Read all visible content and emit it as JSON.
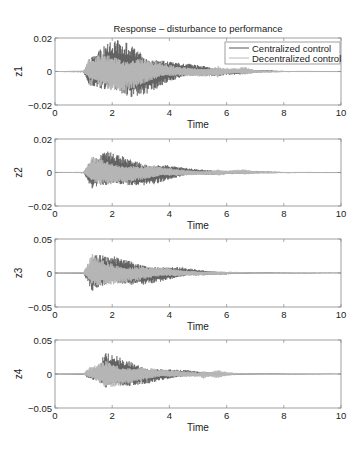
{
  "chart_data": [
    {
      "type": "line",
      "title": "Response – disturbance to performance",
      "xlabel": "Time",
      "ylabel": "z1",
      "xlim": [
        0,
        10
      ],
      "ylim": [
        -0.02,
        0.02
      ],
      "xticks": [
        "0",
        "2",
        "4",
        "6",
        "8",
        "10"
      ],
      "yticks": [
        "-0.02",
        "0",
        "0.02"
      ],
      "grid": false,
      "legend": {
        "position": "upper right",
        "entries": [
          "Centralized control",
          "Decentralized control"
        ]
      },
      "series": [
        {
          "name": "Centralized control",
          "color": "#555555",
          "envelope": {
            "t": [
              0,
              1.0,
              1.2,
              1.5,
              1.8,
              2.2,
              2.5,
              2.8,
              3.2,
              3.6,
              4.0,
              4.5,
              5.0,
              5.5,
              5.7,
              6.0,
              6.4,
              6.6,
              7.0,
              7.5,
              8.0,
              10
            ],
            "amp": [
              0.0003,
              0.0005,
              0.009,
              0.013,
              0.017,
              0.019,
              0.019,
              0.017,
              0.014,
              0.01,
              0.007,
              0.005,
              0.004,
              0.003,
              0.003,
              0.002,
              0.002,
              0.002,
              0.001,
              0.0007,
              0.0004,
              0.0002
            ]
          }
        },
        {
          "name": "Decentralized control",
          "color": "#b8b8b8",
          "envelope": {
            "t": [
              0,
              1.0,
              1.2,
              1.5,
              1.8,
              2.2,
              2.5,
              2.8,
              3.2,
              3.6,
              4.0,
              4.5,
              5.0,
              5.5,
              5.7,
              6.0,
              6.4,
              6.6,
              7.0,
              7.5,
              8.0,
              10
            ],
            "amp": [
              0.0003,
              0.0005,
              0.008,
              0.011,
              0.012,
              0.012,
              0.011,
              0.01,
              0.008,
              0.006,
              0.004,
              0.003,
              0.003,
              0.003,
              0.004,
              0.002,
              0.002,
              0.003,
              0.001,
              0.0006,
              0.0004,
              0.0002
            ]
          }
        }
      ]
    },
    {
      "type": "line",
      "xlabel": "Time",
      "ylabel": "z2",
      "xlim": [
        0,
        10
      ],
      "ylim": [
        -0.02,
        0.02
      ],
      "xticks": [
        "0",
        "2",
        "4",
        "6",
        "8",
        "10"
      ],
      "yticks": [
        "-0.02",
        "0",
        "0.02"
      ],
      "grid": false,
      "series": [
        {
          "name": "Centralized control",
          "color": "#555555",
          "envelope": {
            "t": [
              0,
              1.0,
              1.3,
              1.5,
              1.8,
              2.2,
              2.6,
              3.0,
              3.5,
              4.0,
              4.5,
              5.0,
              5.5,
              6.0,
              6.5,
              7.0,
              8.0,
              10
            ],
            "amp": [
              0.0002,
              0.0004,
              0.011,
              0.01,
              0.013,
              0.011,
              0.009,
              0.008,
              0.007,
              0.005,
              0.003,
              0.002,
              0.0015,
              0.001,
              0.001,
              0.0007,
              0.0004,
              0.0002
            ]
          }
        },
        {
          "name": "Decentralized control",
          "color": "#b8b8b8",
          "envelope": {
            "t": [
              0,
              1.0,
              1.3,
              1.5,
              1.8,
              2.2,
              2.6,
              3.0,
              3.5,
              4.0,
              4.5,
              5.0,
              5.5,
              5.7,
              6.0,
              6.5,
              6.6,
              7.0,
              8.0,
              10
            ],
            "amp": [
              0.0002,
              0.0004,
              0.01,
              0.009,
              0.008,
              0.007,
              0.006,
              0.005,
              0.004,
              0.003,
              0.002,
              0.0015,
              0.0015,
              0.0022,
              0.0012,
              0.0018,
              0.002,
              0.0008,
              0.0004,
              0.0002
            ]
          }
        }
      ]
    },
    {
      "type": "line",
      "xlabel": "Time",
      "ylabel": "z3",
      "xlim": [
        0,
        10
      ],
      "ylim": [
        -0.05,
        0.05
      ],
      "xticks": [
        "0",
        "2",
        "4",
        "6",
        "8",
        "10"
      ],
      "yticks": [
        "-0.05",
        "0",
        "0.05"
      ],
      "grid": false,
      "series": [
        {
          "name": "Centralized control",
          "color": "#555555",
          "envelope": {
            "t": [
              0,
              1.0,
              1.2,
              1.3,
              1.6,
              2.0,
              2.5,
              3.0,
              3.5,
              4.0,
              4.5,
              5.0,
              5.5,
              6.0,
              6.5,
              7.0,
              8.0,
              10
            ],
            "amp": [
              0.0005,
              0.001,
              0.02,
              0.032,
              0.028,
              0.025,
              0.021,
              0.018,
              0.015,
              0.011,
              0.008,
              0.005,
              0.003,
              0.002,
              0.0015,
              0.001,
              0.0006,
              0.0003
            ]
          }
        },
        {
          "name": "Decentralized control",
          "color": "#b8b8b8",
          "envelope": {
            "t": [
              0,
              1.0,
              1.2,
              1.3,
              1.6,
              2.0,
              2.5,
              3.0,
              3.5,
              4.0,
              4.5,
              5.0,
              5.5,
              6.0,
              6.5,
              7.0,
              8.0,
              10
            ],
            "amp": [
              0.0005,
              0.001,
              0.02,
              0.03,
              0.022,
              0.018,
              0.014,
              0.011,
              0.009,
              0.007,
              0.005,
              0.004,
              0.003,
              0.002,
              0.0015,
              0.001,
              0.0006,
              0.0003
            ]
          }
        }
      ]
    },
    {
      "type": "line",
      "xlabel": "Time",
      "ylabel": "z4",
      "xlim": [
        0,
        10
      ],
      "ylim": [
        -0.05,
        0.05
      ],
      "xticks": [
        "0",
        "2",
        "4",
        "6",
        "8",
        "10"
      ],
      "yticks": [
        "-0.05",
        "0",
        "0.05"
      ],
      "grid": false,
      "series": [
        {
          "name": "Centralized control",
          "color": "#555555",
          "envelope": {
            "t": [
              0,
              1.0,
              1.2,
              1.5,
              1.7,
              1.8,
              2.2,
              2.6,
              3.0,
              3.5,
              4.0,
              4.5,
              5.0,
              5.5,
              6.0,
              6.5,
              7.0,
              8.0,
              10
            ],
            "amp": [
              0.0005,
              0.001,
              0.008,
              0.012,
              0.03,
              0.032,
              0.026,
              0.021,
              0.016,
              0.012,
              0.008,
              0.006,
              0.004,
              0.003,
              0.002,
              0.0015,
              0.001,
              0.0006,
              0.0003
            ]
          }
        },
        {
          "name": "Decentralized control",
          "color": "#b8b8b8",
          "envelope": {
            "t": [
              0,
              1.0,
              1.2,
              1.5,
              1.7,
              1.8,
              2.2,
              2.6,
              3.0,
              3.5,
              4.0,
              4.5,
              5.0,
              5.2,
              5.4,
              5.7,
              6.0,
              6.5,
              7.0,
              8.0,
              10
            ],
            "amp": [
              0.0005,
              0.001,
              0.01,
              0.015,
              0.022,
              0.022,
              0.018,
              0.014,
              0.011,
              0.008,
              0.006,
              0.005,
              0.004,
              0.007,
              0.004,
              0.007,
              0.003,
              0.0015,
              0.001,
              0.0006,
              0.0003
            ]
          }
        }
      ]
    }
  ],
  "layout": {
    "axes_boxes": [
      {
        "left": 55,
        "top": 38,
        "right": 341,
        "bottom": 105
      },
      {
        "left": 55,
        "top": 139,
        "right": 341,
        "bottom": 206
      },
      {
        "left": 55,
        "top": 239,
        "right": 341,
        "bottom": 307
      },
      {
        "left": 55,
        "top": 340,
        "right": 341,
        "bottom": 408
      }
    ],
    "legend_box": {
      "left": 225,
      "top": 42,
      "right": 340,
      "bottom": 64
    }
  }
}
